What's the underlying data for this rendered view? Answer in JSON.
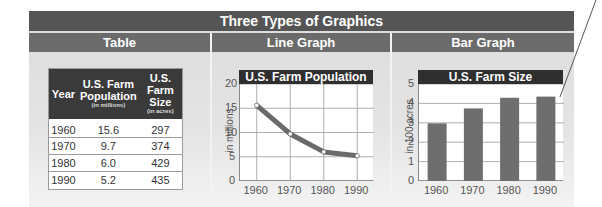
{
  "title": "Three Types of Graphics",
  "sections": [
    {
      "label": "Table"
    },
    {
      "label": "Line Graph"
    },
    {
      "label": "Bar Graph"
    }
  ],
  "table": {
    "headers": [
      {
        "title": "Year",
        "sub": ""
      },
      {
        "title": "U.S. Farm Population",
        "title_l1": "U.S. Farm",
        "title_l2": "Population",
        "sub": "(in millions)"
      },
      {
        "title": "U.S. Farm Size",
        "title_l1": "U.S. Farm",
        "title_l2": "Size",
        "sub": "(in acres)"
      }
    ],
    "rows": [
      [
        "1960",
        "15.6",
        "297"
      ],
      [
        "1970",
        "9.7",
        "374"
      ],
      [
        "1980",
        "6.0",
        "429"
      ],
      [
        "1990",
        "5.2",
        "435"
      ]
    ]
  },
  "chart_data": [
    {
      "type": "line",
      "title": "U.S. Farm Population",
      "xlabel": "",
      "ylabel": "in millions",
      "categories": [
        "1960",
        "1970",
        "1980",
        "1990"
      ],
      "values": [
        15.6,
        9.7,
        6.0,
        5.2
      ],
      "yticks": [
        "0",
        "5",
        "10",
        "15",
        "20"
      ],
      "ylim": [
        0,
        20
      ],
      "grid": true,
      "color": "#6a6a6a"
    },
    {
      "type": "bar",
      "title": "U.S. Farm Size",
      "xlabel": "",
      "ylabel": "in 100 acres",
      "categories": [
        "1960",
        "1970",
        "1980",
        "1990"
      ],
      "values": [
        2.97,
        3.74,
        4.29,
        4.35
      ],
      "yticks": [
        "0",
        "1",
        "2",
        "3",
        "4",
        "5"
      ],
      "ylim": [
        0,
        5
      ],
      "grid": true,
      "color": "#6e6e6e"
    }
  ],
  "colors": {
    "title_bar": "#555555",
    "section_bar": "#6b6b6b",
    "chart_title_bar": "#2f2f2f",
    "table_header": "#3a3a3a",
    "panel_bg": "#e0e0e0"
  }
}
